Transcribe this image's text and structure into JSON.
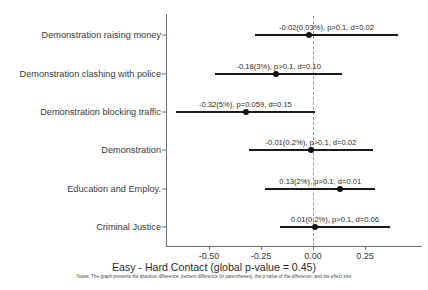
{
  "chart_data": {
    "type": "scatter",
    "subtype": "forest-plot",
    "title": "",
    "xlabel": "Easy - Hard Contact (global p-value = 0.45)",
    "ylabel": "",
    "xlim": [
      -0.72,
      0.52
    ],
    "xticks": [
      -0.5,
      -0.25,
      0.0,
      0.25
    ],
    "xticklabels": [
      "-0.50",
      "-0.25",
      "0.00",
      "0.25"
    ],
    "grid": false,
    "legend": null,
    "reference_line": {
      "x": 0.0,
      "style": "dashed",
      "color": "#9a9a9a"
    },
    "categories": [
      "Demonstration raising money",
      "Demonstration clashing with police",
      "Demonstration blocking traffic",
      "Demonstration",
      "Education and Employ.",
      "Criminal Justice"
    ],
    "points": [
      {
        "category": "Demonstration raising money",
        "estimate": -0.02,
        "ci_low": -0.28,
        "ci_high": 0.41,
        "percent_difference": "0.03%",
        "p_value": "p>0.1",
        "effect_size": "d=0.02",
        "annotation": "-0.02(0.03%), p>0.1, d=0.02"
      },
      {
        "category": "Demonstration clashing with police",
        "estimate": -0.18,
        "ci_low": -0.47,
        "ci_high": 0.14,
        "percent_difference": "3%",
        "p_value": "p>0.1",
        "effect_size": "d=0.10",
        "annotation": "-0.18(3%), p>0.1, d=0.10"
      },
      {
        "category": "Demonstration blocking traffic",
        "estimate": -0.32,
        "ci_low": -0.66,
        "ci_high": 0.01,
        "percent_difference": "5%",
        "p_value": "p=0.059",
        "effect_size": "d=0.15",
        "annotation": "-0.32(5%), p=0.059, d=0.15"
      },
      {
        "category": "Demonstration",
        "estimate": -0.01,
        "ci_low": -0.31,
        "ci_high": 0.29,
        "percent_difference": "0.2%",
        "p_value": "p>0.1",
        "effect_size": "d=0.02",
        "annotation": "-0.01(0.2%), p>0.1, d=0.02"
      },
      {
        "category": "Education and Employ.",
        "estimate": 0.13,
        "ci_low": -0.23,
        "ci_high": 0.3,
        "percent_difference": "2%",
        "p_value": "p>0.1",
        "effect_size": "d=0.01",
        "annotation": "0.13(2%), p>0.1, d=0.01"
      },
      {
        "category": "Criminal Justice",
        "estimate": 0.01,
        "ci_low": -0.16,
        "ci_high": 0.37,
        "percent_difference": "0.2%",
        "p_value": "p>0.1",
        "effect_size": "d=0.06",
        "annotation": "0.01(0.2%), p>0.1, d=0.06"
      }
    ],
    "notes": "Notes: The graph presents the absolute difference, percent difference (in parentheses), the p-value of the difference, and the effect size"
  },
  "colors": {
    "point": "#111111",
    "ci": "#1a1a1a",
    "axis": "#6f6f6f",
    "reference": "#9a9a9a",
    "background": "#ffffff",
    "text": "#2b2b2b"
  }
}
